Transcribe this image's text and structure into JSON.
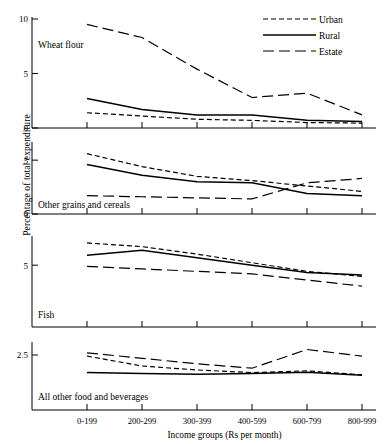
{
  "axis": {
    "ylabel": "Percentage of total expenditure",
    "xlabel": "Income  groups (Rs per month)"
  },
  "legend": {
    "position": "top-right",
    "entries": [
      {
        "label": "Urban",
        "style": "short-dash"
      },
      {
        "label": "Rural",
        "style": "solid"
      },
      {
        "label": "Estate",
        "style": "long-dash"
      }
    ]
  },
  "chart_data": {
    "type": "line",
    "title": "",
    "xlabel": "Income  groups (Rs per month)",
    "ylabel": "Percentage of total expenditure",
    "grid": false,
    "legend_position": "top-right",
    "categories": [
      "0-199",
      "200-299",
      "300-399",
      "400-599",
      "600-799",
      "800-999"
    ],
    "panels": [
      {
        "name": "Wheat flour",
        "ylim": [
          0,
          10
        ],
        "yticks": [
          0,
          5,
          10
        ],
        "ytick_labels": [
          "0",
          "5",
          "10"
        ],
        "series": [
          {
            "name": "Urban",
            "style": "short-dash",
            "values": [
              1.4,
              1.1,
              0.8,
              0.7,
              0.5,
              0.45
            ]
          },
          {
            "name": "Rural",
            "style": "solid",
            "values": [
              2.7,
              1.7,
              1.2,
              1.2,
              0.7,
              0.6
            ]
          },
          {
            "name": "Estate",
            "style": "long-dash",
            "values": [
              9.5,
              8.3,
              5.4,
              2.8,
              3.2,
              1.2
            ]
          }
        ]
      },
      {
        "name": "Other grains and cereals",
        "ylim": [
          0,
          6.5
        ],
        "yticks": [
          0,
          5
        ],
        "ytick_labels": [
          "0",
          "5"
        ],
        "series": [
          {
            "name": "Urban",
            "style": "short-dash",
            "values": [
              5.6,
              4.4,
              3.5,
              3.1,
              2.6,
              2.1
            ]
          },
          {
            "name": "Rural",
            "style": "solid",
            "values": [
              4.6,
              3.6,
              3.0,
              2.9,
              1.9,
              1.7
            ]
          },
          {
            "name": "Estate",
            "style": "long-dash",
            "values": [
              1.7,
              1.6,
              1.5,
              1.4,
              2.9,
              3.3
            ]
          }
        ]
      },
      {
        "name": "Fish",
        "ylim": [
          0,
          7.2
        ],
        "yticks": [
          5
        ],
        "ytick_labels": [
          "5"
        ],
        "series": [
          {
            "name": "Urban",
            "style": "short-dash",
            "values": [
              6.8,
              6.5,
              5.9,
              5.2,
              4.5,
              4.1
            ]
          },
          {
            "name": "Rural",
            "style": "solid",
            "values": [
              5.8,
              6.2,
              5.6,
              5.0,
              4.4,
              4.2
            ]
          },
          {
            "name": "Estate",
            "style": "long-dash",
            "values": [
              4.9,
              4.7,
              4.5,
              4.3,
              3.8,
              3.3
            ]
          }
        ]
      },
      {
        "name": "All other food and beverages",
        "ylim": [
          0,
          3.0
        ],
        "yticks": [
          2.5
        ],
        "ytick_labels": [
          "2.5"
        ],
        "series": [
          {
            "name": "Urban",
            "style": "short-dash",
            "values": [
              2.45,
              2.0,
              1.82,
              1.7,
              1.78,
              1.6
            ]
          },
          {
            "name": "Rural",
            "style": "solid",
            "values": [
              1.7,
              1.66,
              1.63,
              1.66,
              1.72,
              1.58
            ]
          },
          {
            "name": "Estate",
            "style": "long-dash",
            "values": [
              2.6,
              2.35,
              2.1,
              1.9,
              2.75,
              2.45
            ]
          }
        ]
      }
    ]
  }
}
